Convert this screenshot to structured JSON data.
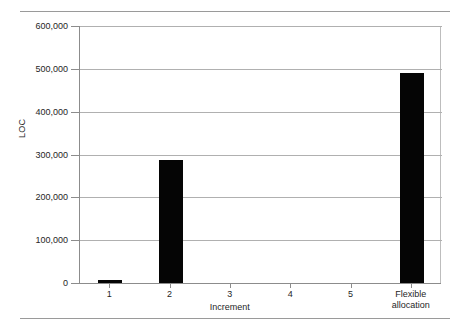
{
  "chart_data": {
    "type": "bar",
    "title": "",
    "xlabel": "Increment",
    "ylabel": "LOC",
    "categories": [
      "1",
      "2",
      "3",
      "4",
      "5",
      "Flexible allocation"
    ],
    "category_lines": [
      [
        "1"
      ],
      [
        "2"
      ],
      [
        "3"
      ],
      [
        "4"
      ],
      [
        "5"
      ],
      [
        "Flexible",
        "allocation"
      ]
    ],
    "values": [
      8000,
      288000,
      0,
      0,
      0,
      490000
    ],
    "ylim": [
      0,
      600000
    ],
    "ytick_values": [
      0,
      100000,
      200000,
      300000,
      400000,
      500000,
      600000
    ],
    "ytick_labels": [
      "0",
      "100,000",
      "200,000",
      "300,000",
      "400,000",
      "500,000",
      "600,000"
    ],
    "grid": true,
    "legend": "none",
    "bar_color": "#050505",
    "gridline_color": "#b0b0b0",
    "axis_color": "#8c8c8c"
  }
}
